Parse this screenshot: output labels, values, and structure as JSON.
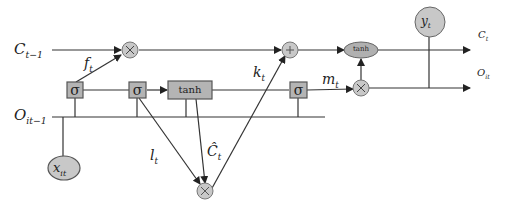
{
  "diagram": {
    "type": "LSTM cell diagram",
    "inputs": {
      "cell_prev": {
        "base": "C",
        "sub": "t−1"
      },
      "output_prev": {
        "base": "O",
        "sub": "it−1"
      },
      "x": {
        "base": "x",
        "sub": "it"
      }
    },
    "outputs": {
      "cell": {
        "base": "C",
        "sub": "t"
      },
      "output": {
        "base": "O",
        "sub": "it"
      },
      "y": {
        "base": "y",
        "sub": "t"
      }
    },
    "gates": {
      "sigma_symbol": "σ",
      "tanh_label": "tanh",
      "times_symbol": "×",
      "plus_symbol": "+"
    },
    "signals": {
      "f": {
        "base": "f",
        "sub": "t"
      },
      "k": {
        "base": "k",
        "sub": "t"
      },
      "m": {
        "base": "m",
        "sub": "t"
      },
      "l": {
        "base": "l",
        "sub": "t"
      },
      "c_hat": {
        "base": "Ĉ",
        "sub": "t"
      }
    },
    "colors": {
      "line": "#333333",
      "node_fill": "#c8c8c8",
      "box_fill": "#b4b4b4",
      "border": "#555555"
    }
  }
}
